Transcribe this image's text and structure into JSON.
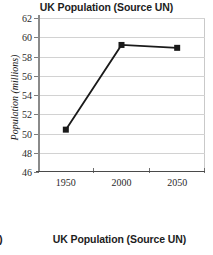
{
  "chart_data": {
    "type": "line",
    "title": "UK Population (Source UN)",
    "xlabel": "",
    "ylabel": "Population (millions)",
    "x": [
      1950,
      2000,
      2050
    ],
    "values": [
      50.4,
      59.2,
      58.9
    ],
    "categories": [
      "1950",
      "2000",
      "2050"
    ],
    "xtick_labels": [
      "1950",
      "2000",
      "2050"
    ],
    "ytick_labels": [
      "46",
      "48",
      "50",
      "52",
      "54",
      "56",
      "58",
      "60",
      "62"
    ],
    "ytick_values": [
      46,
      48,
      50,
      52,
      54,
      56,
      58,
      60,
      62
    ],
    "ylim": [
      46,
      62
    ],
    "xlim": [
      1925,
      2075
    ],
    "grid": "horizontal",
    "legend": "none",
    "marker": "square",
    "series_color": "#1a1a1a",
    "grid_color": "#d2d2d2",
    "axis_color": "#7d7d7d"
  },
  "figure2": {
    "marker_label": "i)",
    "title": "UK Population (Source UN)"
  }
}
